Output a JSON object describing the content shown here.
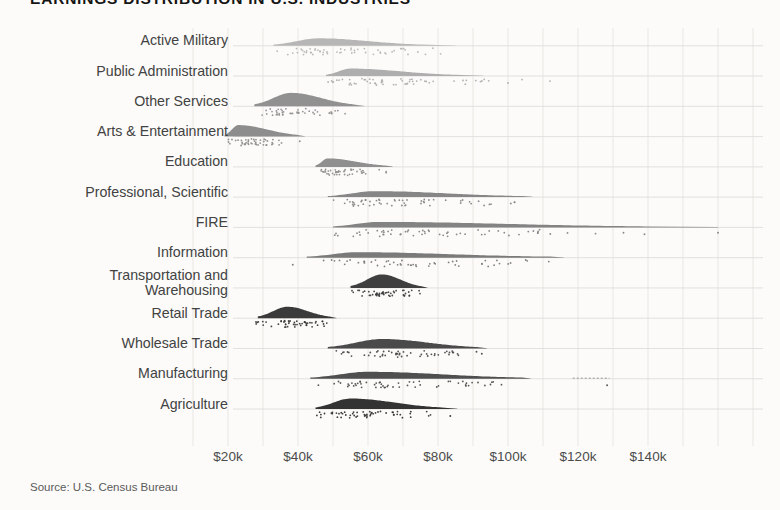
{
  "page": {
    "source": "Source: U.S. Census Bureau"
  },
  "chart_data": {
    "type": "ridgeline",
    "title": "EARNINGS DISTRIBUTION IN U.S. INDUSTRIES",
    "xlabel": "",
    "ylabel": "",
    "x_axis": {
      "unit": "annual earnings, USD",
      "tick_values_k": [
        20,
        40,
        60,
        80,
        100,
        120,
        140
      ],
      "tick_labels": [
        "$20k",
        "$40k",
        "$60k",
        "$80k",
        "$100k",
        "$120k",
        "$140k"
      ],
      "range_k": [
        10,
        170
      ],
      "minor_grid_step_k": 10,
      "grid": true
    },
    "industries": [
      {
        "label": "Active Military",
        "label_lines": [
          "Active Military"
        ],
        "color": "#b6b6b6",
        "min_k": 33,
        "peak_k": 46,
        "max_k": 75,
        "tail_k": 85,
        "peak_h": 7,
        "dots_min_k": 33,
        "dots_max_k": 84,
        "n_dots": 55,
        "outlier_dots_k": []
      },
      {
        "label": "Public Administration",
        "label_lines": [
          "Public Administration"
        ],
        "color": "#aeaeae",
        "min_k": 48,
        "peak_k": 55,
        "max_k": 85,
        "tail_k": 93,
        "peak_h": 7,
        "dots_min_k": 48,
        "dots_max_k": 95,
        "n_dots": 55,
        "outlier_dots_k": [
          100,
          104,
          112
        ]
      },
      {
        "label": "Other Services",
        "label_lines": [
          "Other Services"
        ],
        "color": "#919191",
        "min_k": 27.5,
        "peak_k": 38,
        "max_k": 56,
        "tail_k": 59,
        "peak_h": 13,
        "dots_min_k": 28,
        "dots_max_k": 55,
        "n_dots": 45,
        "outlier_dots_k": []
      },
      {
        "label": "Arts & Entertainment",
        "label_lines": [
          "Arts & Entertainment"
        ],
        "color": "#8d8d8d",
        "min_k": 19,
        "peak_k": 23,
        "max_k": 40,
        "tail_k": 42,
        "peak_h": 11,
        "dots_min_k": 19,
        "dots_max_k": 36,
        "n_dots": 45,
        "outlier_dots_k": [
          40.5
        ]
      },
      {
        "label": "Education",
        "label_lines": [
          "Education"
        ],
        "color": "#8f8f8f",
        "min_k": 45,
        "peak_k": 48.5,
        "max_k": 65,
        "tail_k": 67,
        "peak_h": 8,
        "dots_min_k": 45,
        "dots_max_k": 66,
        "n_dots": 45,
        "outlier_dots_k": []
      },
      {
        "label": "Professional, Scientific",
        "label_lines": [
          "Professional, Scientific"
        ],
        "color": "#868686",
        "min_k": 48.5,
        "peak_k": 62,
        "max_k": 104,
        "tail_k": 107,
        "peak_h": 5.5,
        "dots_min_k": 49,
        "dots_max_k": 104,
        "n_dots": 55,
        "outlier_dots_k": []
      },
      {
        "label": "FIRE",
        "label_lines": [
          "FIRE"
        ],
        "color": "#838383",
        "min_k": 50,
        "peak_k": 63,
        "max_k": 139,
        "tail_k": 160,
        "peak_h": 5,
        "dots_min_k": 50,
        "dots_max_k": 113,
        "n_dots": 55,
        "outlier_dots_k": [
          117,
          125,
          133,
          139,
          160
        ]
      },
      {
        "label": "Information",
        "label_lines": [
          "Information"
        ],
        "color": "#7a7a7a",
        "min_k": 42.5,
        "peak_k": 57,
        "max_k": 112,
        "tail_k": 116,
        "peak_h": 5,
        "dots_min_k": 42,
        "dots_max_k": 112,
        "n_dots": 50,
        "outlier_dots_k": [
          38.5
        ]
      },
      {
        "label": "Transportation and Warehousing",
        "label_lines": [
          "Transportation and",
          "Warehousing"
        ],
        "color": "#3f3f3f",
        "min_k": 55,
        "peak_k": 64,
        "max_k": 75,
        "tail_k": 77,
        "peak_h": 13,
        "dots_min_k": 55,
        "dots_max_k": 77,
        "n_dots": 50,
        "outlier_dots_k": []
      },
      {
        "label": "Retail Trade",
        "label_lines": [
          "Retail Trade"
        ],
        "color": "#3a3a3a",
        "min_k": 28.5,
        "peak_k": 37,
        "max_k": 49,
        "tail_k": 51,
        "peak_h": 11,
        "dots_min_k": 28,
        "dots_max_k": 50,
        "n_dots": 50,
        "outlier_dots_k": []
      },
      {
        "label": "Wholesale Trade",
        "label_lines": [
          "Wholesale Trade"
        ],
        "color": "#4a4a4a",
        "min_k": 48.5,
        "peak_k": 64,
        "max_k": 91,
        "tail_k": 94,
        "peak_h": 9,
        "dots_min_k": 49,
        "dots_max_k": 88,
        "n_dots": 50,
        "outlier_dots_k": [
          91,
          92.5
        ]
      },
      {
        "label": "Manufacturing",
        "label_lines": [
          "Manufacturing"
        ],
        "color": "#4f4f4f",
        "min_k": 43.5,
        "peak_k": 60,
        "max_k": 104,
        "tail_k": 106.5,
        "peak_h": 6.5,
        "dots_min_k": 44,
        "dots_max_k": 100,
        "n_dots": 55,
        "outlier_dots_k": [
          128.3
        ],
        "outlier_segment_k": [
          118.5,
          129
        ]
      },
      {
        "label": "Agriculture",
        "label_lines": [
          "Agriculture"
        ],
        "color": "#333333",
        "min_k": 45,
        "peak_k": 55,
        "max_k": 81,
        "tail_k": 85.5,
        "peak_h": 10,
        "dots_min_k": 45,
        "dots_max_k": 78,
        "n_dots": 55,
        "outlier_dots_k": [
          83.5
        ]
      }
    ]
  }
}
